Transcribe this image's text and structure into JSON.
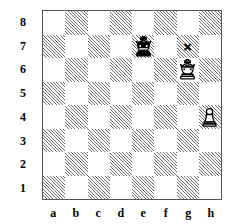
{
  "diagram": {
    "type": "chess-board",
    "orientation": "white-bottom",
    "rank_labels": [
      "8",
      "7",
      "6",
      "5",
      "4",
      "3",
      "2",
      "1"
    ],
    "file_labels": [
      "a",
      "b",
      "c",
      "d",
      "e",
      "f",
      "g",
      "h"
    ],
    "colors": {
      "light_square": "#ffffff",
      "dark_square_hatch": "#6f6f6f",
      "border": "#555555",
      "piece_black": "#000000",
      "piece_white_fill": "#ffffff",
      "label": "#000000",
      "mark": "#000000"
    },
    "pieces": [
      {
        "square": "e7",
        "piece": "king",
        "color": "black",
        "glyph": "black-king-icon"
      },
      {
        "square": "g6",
        "piece": "king",
        "color": "white",
        "glyph": "white-king-icon"
      },
      {
        "square": "h4",
        "piece": "pawn",
        "color": "white",
        "glyph": "white-pawn-icon"
      }
    ],
    "marks": [
      {
        "square": "g7",
        "symbol": "×",
        "name": "cross-mark"
      }
    ]
  }
}
